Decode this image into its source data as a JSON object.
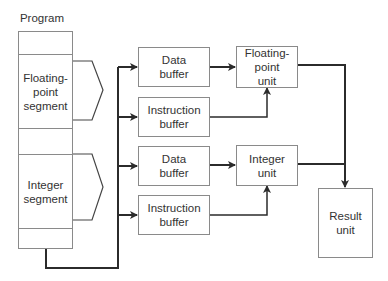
{
  "diagram": {
    "title": "Program",
    "program_segments": [
      {
        "label": ""
      },
      {
        "label": "Floating-\npoint\nsegment"
      },
      {
        "label": ""
      },
      {
        "label": "Integer\nsegment"
      },
      {
        "label": ""
      }
    ],
    "buffers": {
      "fp_data": "Data\nbuffer",
      "fp_instruction": "Instruction\nbuffer",
      "int_data": "Data\nbuffer",
      "int_instruction": "Instruction\nbuffer"
    },
    "units": {
      "floating_point": "Floating-\npoint\nunit",
      "integer": "Integer\nunit",
      "result": "Result\nunit"
    },
    "colors": {
      "line": "#2b2b2b",
      "box_border": "#8a8a8a",
      "text": "#333333"
    }
  }
}
